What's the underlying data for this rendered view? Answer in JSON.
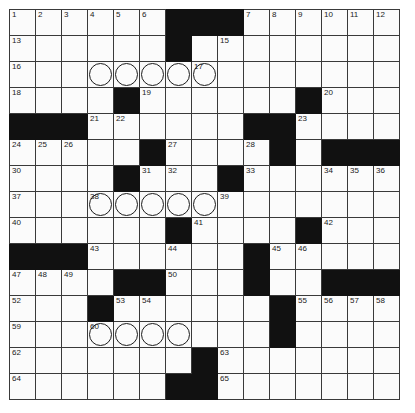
{
  "puzzle": {
    "title": "Crossword Grid",
    "rows": 15,
    "cols": 15,
    "cell_size_px": 26,
    "colors": {
      "block": "#111111",
      "cell": "#fbfbfb",
      "grid_line": "#3a3a3a",
      "number": "#1a1a1a",
      "circle_outline": "#1c1c1c",
      "page_background": "#ffffff"
    },
    "legend": {
      "block_symbol": "#",
      "open_symbol": ".",
      "circle_symbol": "o"
    },
    "grid": [
      "......###......",
      "......#........",
      "...ooooo.......",
      "....#......#...",
      "###......##....",
      ".....#....#.###",
      "....#...#......",
      "...ooooo.......",
      "......#....#...",
      "###......#.....",
      "....##...#..###",
      "...#......#....",
      "...oooo...#....",
      ".......#.......",
      "......##......."
    ],
    "numbers": [
      {
        "n": 1,
        "row": 0,
        "col": 0
      },
      {
        "n": 2,
        "row": 0,
        "col": 1
      },
      {
        "n": 3,
        "row": 0,
        "col": 2
      },
      {
        "n": 4,
        "row": 0,
        "col": 3
      },
      {
        "n": 5,
        "row": 0,
        "col": 4
      },
      {
        "n": 6,
        "row": 0,
        "col": 5
      },
      {
        "n": 7,
        "row": 0,
        "col": 9
      },
      {
        "n": 8,
        "row": 0,
        "col": 10
      },
      {
        "n": 9,
        "row": 0,
        "col": 11
      },
      {
        "n": 10,
        "row": 0,
        "col": 12
      },
      {
        "n": 11,
        "row": 0,
        "col": 13
      },
      {
        "n": 12,
        "row": 0,
        "col": 14
      },
      {
        "n": 13,
        "row": 1,
        "col": 0
      },
      {
        "n": 14,
        "row": 1,
        "col": 6
      },
      {
        "n": 15,
        "row": 1,
        "col": 8
      },
      {
        "n": 16,
        "row": 2,
        "col": 0
      },
      {
        "n": 17,
        "row": 2,
        "col": 7
      },
      {
        "n": 18,
        "row": 3,
        "col": 0
      },
      {
        "n": 19,
        "row": 3,
        "col": 5
      },
      {
        "n": 20,
        "row": 3,
        "col": 12
      },
      {
        "n": 21,
        "row": 4,
        "col": 3
      },
      {
        "n": 22,
        "row": 4,
        "col": 4
      },
      {
        "n": 23,
        "row": 4,
        "col": 11
      },
      {
        "n": 24,
        "row": 5,
        "col": 0
      },
      {
        "n": 25,
        "row": 5,
        "col": 1
      },
      {
        "n": 26,
        "row": 5,
        "col": 2
      },
      {
        "n": 27,
        "row": 5,
        "col": 6
      },
      {
        "n": 28,
        "row": 5,
        "col": 9
      },
      {
        "n": 29,
        "row": 5,
        "col": 10
      },
      {
        "n": 30,
        "row": 6,
        "col": 0
      },
      {
        "n": 31,
        "row": 6,
        "col": 5
      },
      {
        "n": 32,
        "row": 6,
        "col": 6
      },
      {
        "n": 33,
        "row": 6,
        "col": 9
      },
      {
        "n": 34,
        "row": 6,
        "col": 12
      },
      {
        "n": 35,
        "row": 6,
        "col": 13
      },
      {
        "n": 36,
        "row": 6,
        "col": 14
      },
      {
        "n": 37,
        "row": 7,
        "col": 0
      },
      {
        "n": 38,
        "row": 7,
        "col": 3
      },
      {
        "n": 39,
        "row": 7,
        "col": 8
      },
      {
        "n": 40,
        "row": 8,
        "col": 0
      },
      {
        "n": 41,
        "row": 8,
        "col": 7
      },
      {
        "n": 42,
        "row": 8,
        "col": 12
      },
      {
        "n": 43,
        "row": 9,
        "col": 3
      },
      {
        "n": 44,
        "row": 9,
        "col": 6
      },
      {
        "n": 45,
        "row": 9,
        "col": 10
      },
      {
        "n": 46,
        "row": 9,
        "col": 11
      },
      {
        "n": 47,
        "row": 10,
        "col": 0
      },
      {
        "n": 48,
        "row": 10,
        "col": 1
      },
      {
        "n": 49,
        "row": 10,
        "col": 2
      },
      {
        "n": 50,
        "row": 10,
        "col": 6
      },
      {
        "n": 51,
        "row": 10,
        "col": 9
      },
      {
        "n": 52,
        "row": 11,
        "col": 0
      },
      {
        "n": 53,
        "row": 11,
        "col": 4
      },
      {
        "n": 54,
        "row": 11,
        "col": 5
      },
      {
        "n": 55,
        "row": 11,
        "col": 11
      },
      {
        "n": 56,
        "row": 11,
        "col": 12
      },
      {
        "n": 57,
        "row": 11,
        "col": 13
      },
      {
        "n": 58,
        "row": 11,
        "col": 14
      },
      {
        "n": 59,
        "row": 12,
        "col": 0
      },
      {
        "n": 60,
        "row": 12,
        "col": 3
      },
      {
        "n": 61,
        "row": 12,
        "col": 10
      },
      {
        "n": 62,
        "row": 13,
        "col": 0
      },
      {
        "n": 63,
        "row": 13,
        "col": 8
      },
      {
        "n": 64,
        "row": 14,
        "col": 0
      },
      {
        "n": 65,
        "row": 14,
        "col": 8
      }
    ],
    "circles": [
      {
        "row": 2,
        "col": 3
      },
      {
        "row": 2,
        "col": 4
      },
      {
        "row": 2,
        "col": 5
      },
      {
        "row": 2,
        "col": 6
      },
      {
        "row": 2,
        "col": 7
      },
      {
        "row": 7,
        "col": 3
      },
      {
        "row": 7,
        "col": 4
      },
      {
        "row": 7,
        "col": 5
      },
      {
        "row": 7,
        "col": 6
      },
      {
        "row": 7,
        "col": 7
      },
      {
        "row": 12,
        "col": 3
      },
      {
        "row": 12,
        "col": 4
      },
      {
        "row": 12,
        "col": 5
      },
      {
        "row": 12,
        "col": 6
      }
    ],
    "entries": []
  }
}
